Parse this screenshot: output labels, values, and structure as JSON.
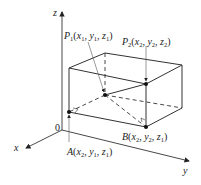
{
  "diagram": {
    "axes": {
      "x_label": "x",
      "y_label": "y",
      "z_label": "z",
      "origin_label": "0"
    },
    "points": {
      "P1": {
        "name": "P",
        "index": "1",
        "coords": [
          "x",
          "1",
          "y",
          "1",
          "z",
          "1"
        ]
      },
      "P2": {
        "name": "P",
        "index": "2",
        "coords": [
          "x",
          "2",
          "y",
          "2",
          "z",
          "2"
        ]
      },
      "A": {
        "name": "A",
        "coords": [
          "x",
          "2",
          "y",
          "1",
          "z",
          "1"
        ]
      },
      "B": {
        "name": "B",
        "coords": [
          "x",
          "2",
          "y",
          "2",
          "z",
          "1"
        ]
      }
    },
    "colors": {
      "line": "#333333",
      "background": "#ffffff"
    }
  }
}
